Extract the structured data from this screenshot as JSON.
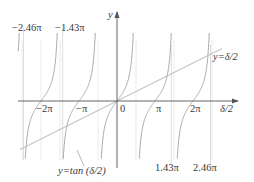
{
  "chart_data": {
    "type": "line",
    "title": "",
    "xlabel": "δ/2",
    "ylabel": "y",
    "x_ticks": [
      "-2π",
      "-π",
      "0",
      "π",
      "2π"
    ],
    "series": [
      {
        "name": "y=tan (δ/2)",
        "kind": "tangent",
        "asymptotes": [
          "-2.5π",
          "-1.5π",
          "-0.5π",
          "0.5π",
          "1.5π",
          "2.5π"
        ]
      },
      {
        "name": "y=δ/2",
        "kind": "linear",
        "slope": 1
      }
    ],
    "intersections": [
      "-2.46π",
      "-1.43π",
      "0",
      "1.43π",
      "2.46π"
    ],
    "annotations": [
      "-2.46π",
      "-1.43π",
      "1.43π",
      "2.46π",
      "y=δ/2",
      "y=tan (δ/2)"
    ],
    "grid": false,
    "legend": "none"
  },
  "labels": {
    "y_axis": "y",
    "x_axis": "δ/2",
    "line_label": "y=δ/2",
    "tan_label": "y=tan (δ/2)",
    "tick_m2pi": "−2π",
    "tick_mpi": "−π",
    "tick_zero": "0",
    "tick_pi": "π",
    "tick_2pi": "2π",
    "root_m246": "−2.46π",
    "root_m143": "−1.43π",
    "root_143": "1.43π",
    "root_246": "2.46π"
  },
  "colors": {
    "axis": "#555555",
    "curve": "#9a9a9a",
    "guide": "#cfcfcf"
  }
}
